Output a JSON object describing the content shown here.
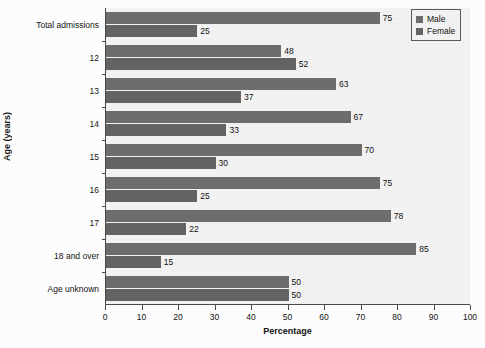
{
  "chart_data": {
    "type": "bar",
    "orientation": "horizontal",
    "title": "",
    "xlabel": "Percentage",
    "ylabel": "Age (years)",
    "xlim": [
      0,
      100
    ],
    "xticks": [
      0,
      10,
      20,
      30,
      40,
      50,
      60,
      70,
      80,
      90,
      100
    ],
    "grid": false,
    "legend_position": "top-right",
    "categories": [
      "Total admissions",
      "12",
      "13",
      "14",
      "15",
      "16",
      "17",
      "18 and over",
      "Age unknown"
    ],
    "series": [
      {
        "name": "Male",
        "color": "#6d6d6d",
        "values": [
          75,
          48,
          63,
          67,
          70,
          75,
          78,
          85,
          50
        ]
      },
      {
        "name": "Female",
        "color": "#636363",
        "values": [
          25,
          52,
          37,
          33,
          30,
          25,
          22,
          15,
          50
        ]
      }
    ]
  },
  "legend": {
    "entries": [
      {
        "label": "Male",
        "swatch": "male"
      },
      {
        "label": "Female",
        "swatch": "female"
      }
    ]
  },
  "colors": {
    "male": "#6d6d6d",
    "female": "#636363",
    "plot_background": "#f2f2f2",
    "axis": "#4a4a4a",
    "text": "#151515"
  }
}
